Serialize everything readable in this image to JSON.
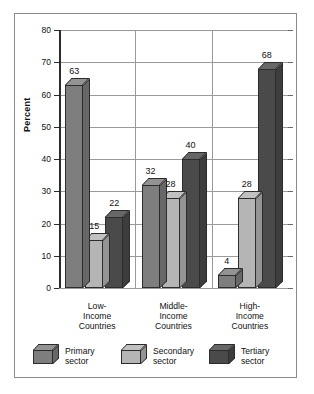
{
  "chart_data": {
    "type": "bar",
    "title": "",
    "xlabel": "",
    "ylabel": "Percent",
    "ylim": [
      0,
      80
    ],
    "yticks": [
      0,
      10,
      20,
      30,
      40,
      50,
      60,
      70,
      80
    ],
    "ytick_labels": [
      "0",
      "10",
      "20",
      "30",
      "40",
      "50",
      "60",
      "70",
      "80"
    ],
    "grid": true,
    "legend_position": "bottom",
    "categories": [
      "Low-\nIncome\nCountries",
      "Middle-\nIncome\nCountries",
      "High-\nIncome\nCountries"
    ],
    "category_lines": [
      [
        "Low-",
        "Income",
        "Countries"
      ],
      [
        "Middle-",
        "Income",
        "Countries"
      ],
      [
        "High-",
        "Income",
        "Countries"
      ]
    ],
    "series": [
      {
        "name": "Primary sector",
        "values": [
          63,
          32,
          4
        ],
        "color": "#7e7e7e"
      },
      {
        "name": "Secondary sector",
        "values": [
          15,
          28,
          28
        ],
        "color": "#b5b5b5"
      },
      {
        "name": "Tertiary sector",
        "values": [
          22,
          40,
          68
        ],
        "color": "#4a4a4a"
      }
    ],
    "data_labels": [
      [
        "63",
        "15",
        "22"
      ],
      [
        "32",
        "28",
        "40"
      ],
      [
        "4",
        "28",
        "68"
      ]
    ]
  },
  "legend": {
    "items": [
      {
        "line1": "Primary",
        "line2": "sector"
      },
      {
        "line1": "Secondary",
        "line2": "sector"
      },
      {
        "line1": "Tertiary",
        "line2": "sector"
      }
    ]
  },
  "axis": {
    "y_label": "Percent"
  },
  "colors": {
    "primary": "#7e7e7e",
    "secondary": "#b5b5b5",
    "tertiary": "#4a4a4a",
    "grid": "#9a9a9a",
    "axis": "#2b2b2b",
    "frame": "#8a8a8a",
    "background": "#ffffff"
  }
}
